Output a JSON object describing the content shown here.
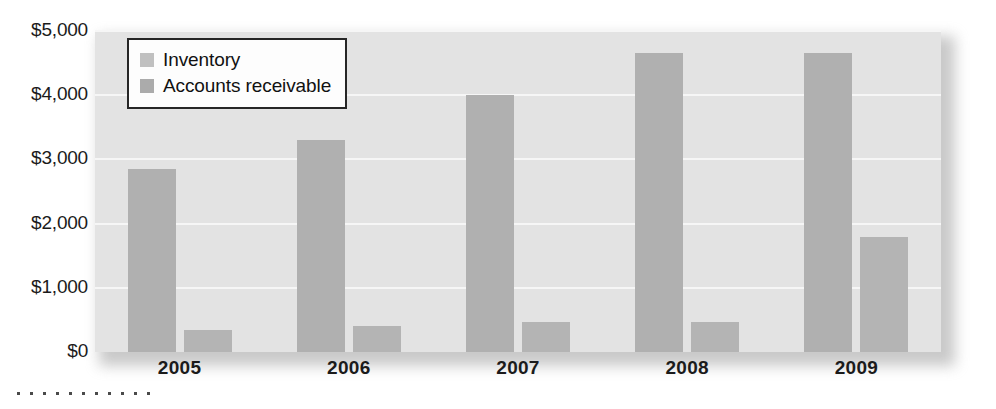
{
  "chart_data": {
    "type": "bar",
    "title": "",
    "subtitle": "",
    "xlabel": "",
    "ylabel": "",
    "categories": [
      "2005",
      "2006",
      "2007",
      "2008",
      "2009"
    ],
    "series": [
      {
        "name": "Inventory",
        "values": [
          2850,
          3300,
          4000,
          4650,
          4650
        ]
      },
      {
        "name": "Accounts receivable",
        "values": [
          345,
          400,
          470,
          460,
          1790
        ]
      }
    ],
    "ylim": [
      0,
      5000
    ],
    "yticks": [
      0,
      1000,
      2000,
      3000,
      4000,
      5000
    ],
    "ytick_labels": [
      "$0",
      "$1,000",
      "$2,000",
      "$3,000",
      "$4,000",
      "$5,000"
    ],
    "grid": true,
    "legend_position": "top-left",
    "colors": {
      "series_0": "#b0b0b0",
      "series_1": "#b4b4b4",
      "plot_background": "#e3e3e3",
      "gridline": "#f6f6f6",
      "legend_border": "#262626",
      "text": "#1b1b1b"
    }
  },
  "legend": {
    "items": [
      {
        "label": "Inventory"
      },
      {
        "label": "Accounts receivable"
      }
    ]
  },
  "decoration": {
    "dot_count": 11
  }
}
